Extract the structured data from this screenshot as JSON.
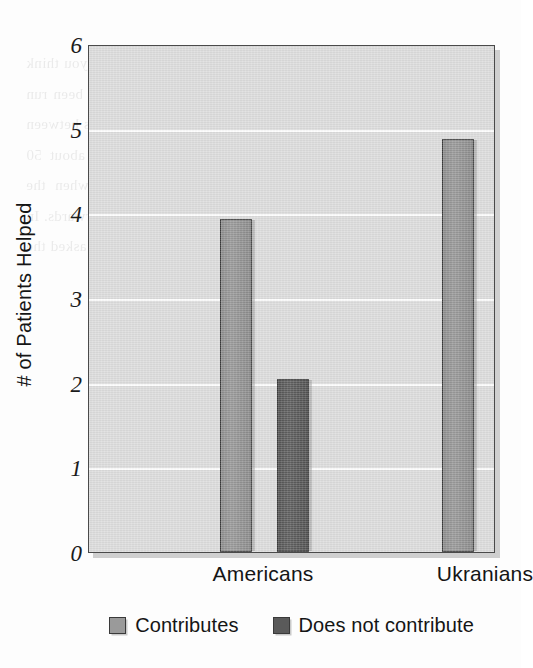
{
  "chart_data": {
    "type": "bar",
    "title": "",
    "subtitle": "",
    "xlabel": "",
    "ylabel": "# of Patients Helped",
    "categories": [
      "Americans",
      "Ukranians"
    ],
    "series": [
      {
        "name": "Contributes",
        "color": "#9a9a9a",
        "values": [
          3.93,
          4.88
        ]
      },
      {
        "name": "Does not contribute",
        "color": "#5a5a5a",
        "values": [
          2.04,
          0.91
        ]
      }
    ],
    "ylim": [
      0,
      6
    ],
    "ytick_labels": [
      "0",
      "1",
      "2",
      "3",
      "4",
      "5",
      "6"
    ],
    "ytick_values": [
      0,
      1,
      2,
      3,
      4,
      5,
      6
    ],
    "grid": "horizontal",
    "gridline_color": "#ffffff",
    "plot_background": "#dcdcdc",
    "legend_position": "bottom-center",
    "legend_entries": [
      "Contributes",
      "Does not contribute"
    ]
  },
  "background_bleed_text": "as imprinted on their mind. The experimenter then asked, \"Do you think it is more important to help...\" and so on. Other studies have been run where people were asked questions about what the difference is between a small and large group of people in need. We found that about 50 percent of the respondents showed clear signs of a bias when the numbers were large, and that they rationalized their choice afterwards. In a later study we designed a variant of the task. In this case we asked the participants to rate the relative value..."
}
